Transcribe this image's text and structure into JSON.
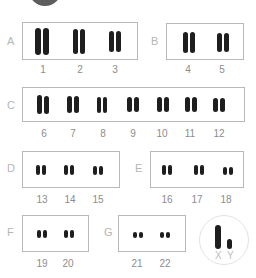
{
  "groups": [
    {
      "letter": "A",
      "chromosomes": [
        "1",
        "2",
        "3"
      ]
    },
    {
      "letter": "B",
      "chromosomes": [
        "4",
        "5"
      ]
    },
    {
      "letter": "C",
      "chromosomes": [
        "6",
        "7",
        "8",
        "9",
        "10",
        "11",
        "12"
      ]
    },
    {
      "letter": "D",
      "chromosomes": [
        "13",
        "14",
        "15"
      ]
    },
    {
      "letter": "E",
      "chromosomes": [
        "16",
        "17",
        "18"
      ]
    },
    {
      "letter": "F",
      "chromosomes": [
        "19",
        "20"
      ]
    },
    {
      "letter": "G",
      "chromosomes": [
        "21",
        "22"
      ]
    }
  ],
  "sex_chromosomes": {
    "x_label": "X",
    "y_label": "Y"
  }
}
